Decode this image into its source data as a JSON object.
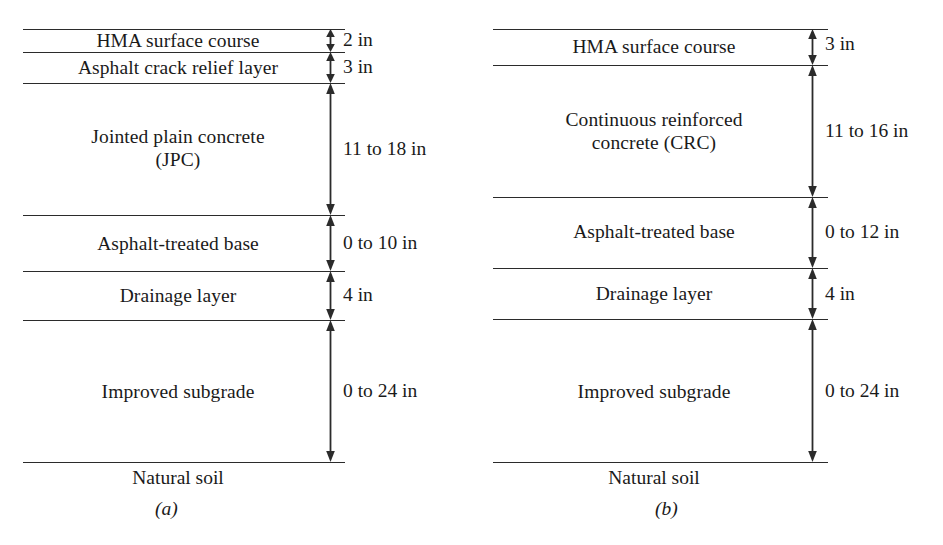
{
  "figure": {
    "type": "pavement-cross-section-diagram",
    "panel_count": 2,
    "units": "in"
  },
  "panels": [
    {
      "caption": "(a)",
      "pavement_type": "Jointed plain concrete (JPC) composite pavement",
      "layers": [
        {
          "name": "HMA surface course",
          "thickness": "2 in",
          "min_in": 2,
          "max_in": 2
        },
        {
          "name": "Asphalt crack relief layer",
          "thickness": "3 in",
          "min_in": 3,
          "max_in": 3
        },
        {
          "name": "Jointed plain concrete\n(JPC)",
          "thickness": "11 to 18 in",
          "min_in": 11,
          "max_in": 18
        },
        {
          "name": "Asphalt-treated base",
          "thickness": "0 to 10 in",
          "min_in": 0,
          "max_in": 10
        },
        {
          "name": "Drainage layer",
          "thickness": "4 in",
          "min_in": 4,
          "max_in": 4
        },
        {
          "name": "Improved subgrade",
          "thickness": "0 to 24 in",
          "min_in": 0,
          "max_in": 24
        }
      ],
      "foundation": "Natural soil"
    },
    {
      "caption": "(b)",
      "pavement_type": "Continuous reinforced concrete (CRC) composite pavement",
      "layers": [
        {
          "name": "HMA surface course",
          "thickness": "3 in",
          "min_in": 3,
          "max_in": 3
        },
        {
          "name": "Continuous reinforced\nconcrete (CRC)",
          "thickness": "11 to 16 in",
          "min_in": 11,
          "max_in": 16
        },
        {
          "name": "Asphalt-treated base",
          "thickness": "0 to 12 in",
          "min_in": 0,
          "max_in": 12
        },
        {
          "name": "Drainage layer",
          "thickness": "4 in",
          "min_in": 4,
          "max_in": 4
        },
        {
          "name": "Improved subgrade",
          "thickness": "0 to 24 in",
          "min_in": 0,
          "max_in": 24
        }
      ],
      "foundation": "Natural soil"
    }
  ],
  "colors": {
    "line": "#2b2b2b",
    "text": "#1a1a1a",
    "background": "#ffffff"
  }
}
